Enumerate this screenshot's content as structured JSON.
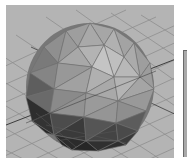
{
  "viewport": {
    "view": "perspective",
    "object": "polygon-sphere",
    "colors": {
      "background": "#b4b4b4",
      "grid_line": "#8e8e8e",
      "grid_axis": "#3c3c3c",
      "sphere_light": "#bdbdbd",
      "sphere_mid": "#9a9a9a",
      "sphere_dark": "#2a2a2a"
    }
  },
  "side_panel": {
    "visible": "partial"
  }
}
